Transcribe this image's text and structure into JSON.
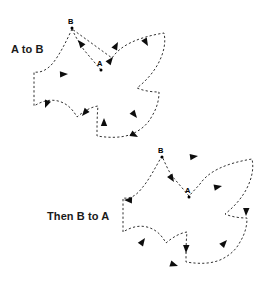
{
  "figure": {
    "title_top": "A to B",
    "title_bottom": "Then B to A",
    "background_color": "#ffffff",
    "stroke_color": "#1a1a1a",
    "arrow_color": "#0d0d0d",
    "line_style": "dashed",
    "width": 274,
    "height": 289
  },
  "captions": [
    {
      "id": "a-to-b",
      "text": "A to B",
      "x": 11,
      "y": 43
    },
    {
      "id": "b-to-a",
      "text": "Then B to A",
      "x": 47,
      "y": 210
    }
  ],
  "diagrams": [
    {
      "id": "top-pinwheel",
      "caption": "A to B",
      "direction": "A to B",
      "center": {
        "x": 100,
        "y": 80
      },
      "arms": 4,
      "points": [
        {
          "label": "A",
          "label_x": 100,
          "label_y": 63,
          "dot_x": 101,
          "dot_y": 70
        },
        {
          "label": "B",
          "label_x": 71,
          "label_y": 21,
          "dot_x": 72,
          "dot_y": 27
        }
      ],
      "arrow_count": 8,
      "path": "M 101 70 L 84 50 C 80 44 76 38 72 29 M 72 29 L 72 29 C 66 42 60 54 53 63 C 47 70 41 73 34 72 L 34 72 C 34 84 34 96 34 106 L 34 106 C 42 101 50 99 58 101 C 66 103 72 108 77 117 L 77 117 C 84 111 91 107 98 106 L 98 106 C 97 116 97 126 97 136 L 97 136 C 110 138 122 138 132 134 C 141 130 148 124 152 116 L 152 116 C 157 108 159 100 159 92 L 159 92 C 152 92 144 91 137 88 L 137 88 C 146 81 154 72 159 62 C 164 52 166 42 164 33 L 164 33 C 152 35 140 38 130 43 C 122 47 116 52 112 58 L 112 58 Z"
    },
    {
      "id": "bottom-pinwheel",
      "caption": "Then B to A",
      "direction": "B to A",
      "center": {
        "x": 188,
        "y": 206
      },
      "arms": 4,
      "points": [
        {
          "label": "A",
          "label_x": 188,
          "label_y": 190,
          "dot_x": 189,
          "dot_y": 196
        },
        {
          "label": "B",
          "label_x": 161,
          "label_y": 150,
          "dot_x": 162,
          "dot_y": 156
        }
      ],
      "arrow_count": 8,
      "path": "M 189 196 L 172 176 C 168 170 165 163 162 156 L 162 156 C 155 168 149 180 142 188 C 136 196 130 199 123 198 L 123 198 C 123 210 123 221 123 232 L 123 232 C 131 227 139 225 147 227 C 155 229 161 234 166 243 L 166 243 C 173 237 180 233 187 232 L 187 232 C 186 242 186 252 186 262 L 186 262 C 199 264 210 264 220 260 C 229 256 236 250 240 242 L 240 242 C 245 234 247 226 247 218 L 247 218 C 240 218 232 217 225 214 L 225 214 C 234 207 242 198 247 188 C 252 178 254 168 252 159 L 252 159 C 240 161 228 164 218 169 C 210 173 204 178 200 184 L 200 184 Z"
    }
  ],
  "arrowheads_top": [
    {
      "id": "t1",
      "x": 78,
      "y": 40,
      "angle": -130
    },
    {
      "id": "t2",
      "x": 116,
      "y": 54,
      "angle": -55
    },
    {
      "id": "t3",
      "x": 137,
      "y": 37,
      "angle": -63
    },
    {
      "id": "t4",
      "x": 160,
      "y": 51,
      "angle": 62
    },
    {
      "id": "t5",
      "x": 138,
      "y": 120,
      "angle": 55
    },
    {
      "id": "t6",
      "x": 122,
      "y": 137,
      "angle": 40
    },
    {
      "id": "t7",
      "x": 97,
      "y": 123,
      "angle": -90
    },
    {
      "id": "t8",
      "x": 80,
      "y": 114,
      "angle": 120
    },
    {
      "id": "t9",
      "x": 46,
      "y": 106,
      "angle": 115
    },
    {
      "id": "t10",
      "x": 61,
      "y": 73,
      "angle": -5
    }
  ],
  "arrowheads_bottom": [
    {
      "id": "b1",
      "x": 190,
      "y": 154,
      "angle": -5
    },
    {
      "id": "b2",
      "x": 172,
      "y": 178,
      "angle": 58
    },
    {
      "id": "b3",
      "x": 134,
      "y": 201,
      "angle": 185
    },
    {
      "id": "b4",
      "x": 147,
      "y": 240,
      "angle": -55
    },
    {
      "id": "b5",
      "x": 180,
      "y": 250,
      "angle": 95
    },
    {
      "id": "b6",
      "x": 172,
      "y": 268,
      "angle": 20
    },
    {
      "id": "b7",
      "x": 224,
      "y": 240,
      "angle": -50
    },
    {
      "id": "b8",
      "x": 244,
      "y": 214,
      "angle": 95
    },
    {
      "id": "b9",
      "x": 218,
      "y": 186,
      "angle": -10
    }
  ]
}
